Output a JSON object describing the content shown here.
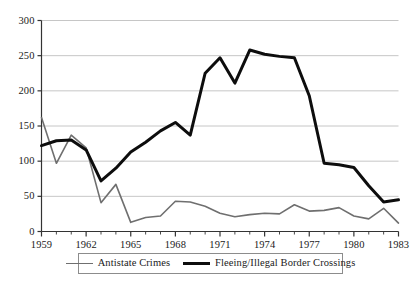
{
  "chart_data": {
    "type": "line",
    "title": "",
    "xlabel": "",
    "ylabel": "",
    "xlim": [
      1959,
      1983
    ],
    "ylim": [
      0,
      300
    ],
    "ytick_values": [
      0,
      50,
      100,
      150,
      200,
      250,
      300
    ],
    "ytick_labels": [
      "0",
      "50",
      "100",
      "150",
      "200",
      "250",
      "300"
    ],
    "xtick_values": [
      1959,
      1962,
      1965,
      1968,
      1971,
      1974,
      1977,
      1980,
      1983
    ],
    "xtick_labels": [
      "1959",
      "1962",
      "1965",
      "1968",
      "1971",
      "1974",
      "1977",
      "1980",
      "1983"
    ],
    "x_minor_tick_step": 1,
    "grid": "horizontal",
    "legend_position": "below-axes",
    "x": [
      1959,
      1960,
      1961,
      1962,
      1963,
      1964,
      1965,
      1966,
      1967,
      1968,
      1969,
      1970,
      1971,
      1972,
      1973,
      1974,
      1975,
      1976,
      1977,
      1978,
      1979,
      1980,
      1981,
      1982,
      1983
    ],
    "series": [
      {
        "name": "Antistate Crimes",
        "color": "#6f6f6f",
        "line_width": 1.6,
        "values": [
          162,
          97,
          137,
          119,
          41,
          67,
          13,
          20,
          22,
          43,
          42,
          36,
          26,
          21,
          24,
          26,
          25,
          38,
          29,
          30,
          34,
          22,
          18,
          33,
          12
        ]
      },
      {
        "name": "Fleeing/Illegal Border Crossings",
        "color": "#0d0d0d",
        "line_width": 3,
        "values": [
          122,
          129,
          130,
          116,
          72,
          90,
          113,
          127,
          143,
          155,
          137,
          225,
          247,
          211,
          258,
          252,
          249,
          247,
          193,
          97,
          95,
          91,
          65,
          42,
          45
        ]
      }
    ],
    "legend": [
      {
        "label": "Antistate Crimes",
        "swatch": "thin-gray-line"
      },
      {
        "label": "Fleeing/Illegal Border Crossings",
        "swatch": "thick-black-line"
      }
    ],
    "colors": {
      "antistate_crimes": "#6f6f6f",
      "border_crossings": "#0d0d0d",
      "grid": "#b8b8b8",
      "axis": "#333333",
      "legend_border": "#8c8c8c",
      "background": "#ffffff"
    }
  }
}
